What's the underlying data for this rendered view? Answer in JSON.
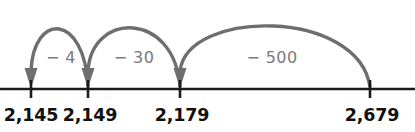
{
  "diagram": {
    "type": "number-line",
    "axis": {
      "color": "#1b1b1b",
      "y": 89,
      "x_start": 0,
      "x_end": 415
    },
    "ticks": [
      {
        "label": "2,145",
        "value": 2145,
        "x": 31,
        "label_x": 31,
        "label_y": 121
      },
      {
        "label": "2,149",
        "value": 2149,
        "x": 88,
        "label_x": 90,
        "label_y": 121
      },
      {
        "label": "2,179",
        "value": 2179,
        "x": 180,
        "label_x": 182,
        "label_y": 121
      },
      {
        "label": "2,679",
        "value": 2679,
        "x": 370,
        "label_x": 372,
        "label_y": 121
      }
    ],
    "jumps": [
      {
        "label": "− 4",
        "amount": -4,
        "from_value": 2149,
        "from_x": 88,
        "to_value": 2145,
        "to_x": 31,
        "apex_y": 30,
        "arrow_at": "left",
        "label_x": 61,
        "label_y": 63,
        "color": "#6e6e6e"
      },
      {
        "label": "− 30",
        "amount": -30,
        "from_value": 2179,
        "from_x": 180,
        "to_value": 2149,
        "to_x": 88,
        "apex_y": 29,
        "arrow_at": "left",
        "label_x": 134,
        "label_y": 63,
        "color": "#6e6e6e"
      },
      {
        "label": "− 500",
        "amount": -500,
        "from_value": 2679,
        "from_x": 370,
        "to_value": 2179,
        "to_x": 180,
        "apex_y": 27,
        "arrow_at": "left",
        "label_x": 272,
        "label_y": 63,
        "color": "#6e6e6e"
      }
    ],
    "colors": {
      "axis": "#1b1b1b",
      "tick_label": "#111111",
      "arc": "#6e6e6e",
      "jump_label": "#7a7a7a",
      "background": "#ffffff"
    }
  }
}
